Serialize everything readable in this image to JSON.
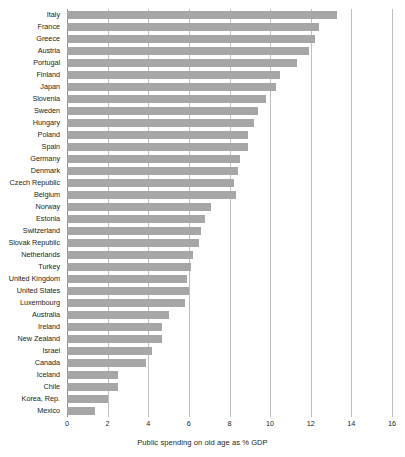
{
  "chart_data": {
    "type": "bar",
    "orientation": "horizontal",
    "title": "",
    "subtitle": "",
    "xlabel": "Public spending on old age as % GDP",
    "ylabel": "",
    "xlim": [
      0,
      16
    ],
    "xticks": [
      0,
      2,
      4,
      6,
      8,
      10,
      12,
      14,
      16
    ],
    "xtick_labels": [
      "0",
      "2",
      "4",
      "6",
      "8",
      "10",
      "12",
      "14",
      "16"
    ],
    "grid": "vertical",
    "legend": "none",
    "bar_color": "#a6a6a6",
    "gridline_color": "#bfbfbf",
    "text_color": "#231f20",
    "background": "#ffffff",
    "categories": [
      "Italy",
      "France",
      "Greece",
      "Austria",
      "Portugal",
      "Finland",
      "Japan",
      "Slovenia",
      "Sweden",
      "Hungary",
      "Poland",
      "Spain",
      "Germany",
      "Denmark",
      "Czech Republic",
      "Belgium",
      "Norway",
      "Estonia",
      "Switzerland",
      "Slovak Republic",
      "Netherlands",
      "Turkey",
      "United Kingdom",
      "United States",
      "Luxembourg",
      "Australia",
      "Ireland",
      "New Zealand",
      "Israel",
      "Canada",
      "Iceland",
      "Chile",
      "Korea, Rep.",
      "Mexico"
    ],
    "values": [
      13.3,
      12.4,
      12.2,
      11.9,
      11.3,
      10.5,
      10.3,
      9.8,
      9.4,
      9.2,
      8.9,
      8.9,
      8.5,
      8.4,
      8.2,
      8.3,
      7.1,
      6.8,
      6.6,
      6.5,
      6.2,
      6.1,
      5.9,
      6.0,
      5.8,
      5.0,
      4.7,
      4.7,
      4.2,
      3.9,
      2.5,
      2.5,
      2.0,
      1.4
    ]
  }
}
